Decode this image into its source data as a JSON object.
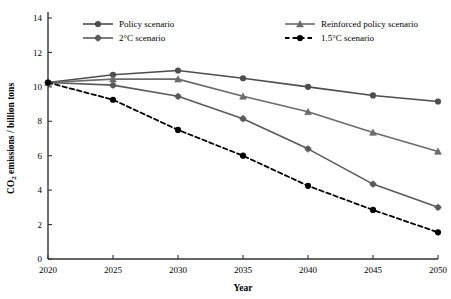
{
  "chart_data": {
    "type": "line",
    "title": "",
    "xlabel": "Year",
    "ylabel": "CO2 emissions / billion tons",
    "ylabel_rich": "CO₂ emissions / billion tons",
    "x": [
      2020,
      2025,
      2030,
      2035,
      2040,
      2045,
      2050
    ],
    "xtick_labels": [
      "2020",
      "2025",
      "2030",
      "2035",
      "2040",
      "2045",
      "2050"
    ],
    "ytick_labels": [
      "0",
      "2",
      "4",
      "6",
      "8",
      "10",
      "12",
      "14"
    ],
    "yticks": [
      0,
      2,
      4,
      6,
      8,
      10,
      12,
      14
    ],
    "xlim": [
      2020,
      2050
    ],
    "ylim": [
      0,
      14
    ],
    "grid": false,
    "legend_position": "top",
    "series": [
      {
        "name": "Policy scenario",
        "marker": "circle",
        "dash": false,
        "color": "#4d4d4d",
        "values": [
          10.25,
          10.7,
          10.95,
          10.5,
          10.0,
          9.5,
          9.15
        ]
      },
      {
        "name": "Reinforced policy scenario",
        "marker": "triangle",
        "dash": false,
        "color": "#6b6b6b",
        "values": [
          10.25,
          10.45,
          10.45,
          9.45,
          8.55,
          7.35,
          6.25
        ]
      },
      {
        "name": "2°C scenario",
        "marker": "plus-circle",
        "dash": false,
        "color": "#5a5a5a",
        "values": [
          10.25,
          10.1,
          9.45,
          8.15,
          6.4,
          4.35,
          3.0
        ]
      },
      {
        "name": "1.5°C scenario",
        "marker": "circle",
        "dash": true,
        "color": "#000000",
        "values": [
          10.25,
          9.25,
          7.5,
          6.0,
          4.25,
          2.85,
          1.55
        ]
      }
    ]
  },
  "legend": {
    "entries": [
      {
        "label": "Policy scenario"
      },
      {
        "label": "Reinforced policy scenario"
      },
      {
        "label": "2°C scenario"
      },
      {
        "label": "1.5°C scenario"
      }
    ]
  },
  "axes": {
    "x_title": "Year",
    "y_title_main": "CO",
    "y_title_sub": "2",
    "y_title_rest": " emissions / billion tons"
  }
}
